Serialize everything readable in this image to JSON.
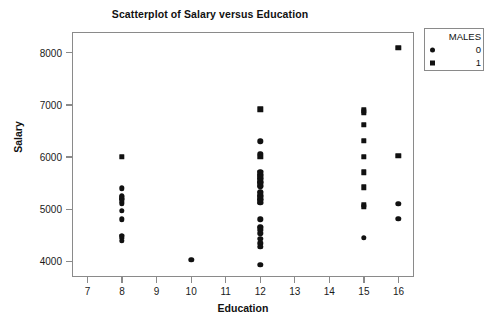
{
  "chart_data": {
    "type": "scatter",
    "title": "Scatterplot of Salary versus Education",
    "xlabel": "Education",
    "ylabel": "Salary",
    "xlim": [
      6.55,
      16.45
    ],
    "ylim": [
      3700,
      8400
    ],
    "xticks": [
      7,
      8,
      9,
      10,
      11,
      12,
      13,
      14,
      15,
      16
    ],
    "yticks": [
      4000,
      5000,
      6000,
      7000,
      8000
    ],
    "grid": false,
    "legend": {
      "title": "MALES",
      "position": "upper-right-outside",
      "entries": [
        {
          "label": "0",
          "marker": "circle"
        },
        {
          "label": "1",
          "marker": "square"
        }
      ]
    },
    "series": [
      {
        "name": "0",
        "marker": "circle",
        "points": [
          [
            8,
            5400
          ],
          [
            8,
            5250
          ],
          [
            8,
            5200
          ],
          [
            8,
            5100
          ],
          [
            8,
            4970
          ],
          [
            8,
            4810
          ],
          [
            8,
            4490
          ],
          [
            8,
            4390
          ],
          [
            10,
            4030
          ],
          [
            12,
            6300
          ],
          [
            12,
            6060
          ],
          [
            12,
            5720
          ],
          [
            12,
            5650
          ],
          [
            12,
            5590
          ],
          [
            12,
            5520
          ],
          [
            12,
            5440
          ],
          [
            12,
            5330
          ],
          [
            12,
            5250
          ],
          [
            12,
            5180
          ],
          [
            12,
            5120
          ],
          [
            12,
            4810
          ],
          [
            12,
            4660
          ],
          [
            12,
            4540
          ],
          [
            12,
            4430
          ],
          [
            12,
            4350
          ],
          [
            12,
            4280
          ],
          [
            12,
            3930
          ],
          [
            15,
            4450
          ],
          [
            16,
            5110
          ],
          [
            16,
            4820
          ]
        ]
      },
      {
        "name": "1",
        "marker": "square",
        "points": [
          [
            8,
            6000
          ],
          [
            8,
            5220
          ],
          [
            8,
            5160
          ],
          [
            8,
            4470
          ],
          [
            12,
            6920
          ],
          [
            12,
            6000
          ],
          [
            12,
            5700
          ],
          [
            12,
            5620
          ],
          [
            12,
            5550
          ],
          [
            12,
            5480
          ],
          [
            12,
            5300
          ],
          [
            12,
            5220
          ],
          [
            12,
            5150
          ],
          [
            12,
            4630
          ],
          [
            15,
            6900
          ],
          [
            15,
            6860
          ],
          [
            15,
            6620
          ],
          [
            15,
            6310
          ],
          [
            15,
            6010
          ],
          [
            15,
            5710
          ],
          [
            15,
            5420
          ],
          [
            15,
            5090
          ],
          [
            15,
            5050
          ],
          [
            16,
            8100
          ],
          [
            16,
            6020
          ]
        ]
      }
    ]
  }
}
